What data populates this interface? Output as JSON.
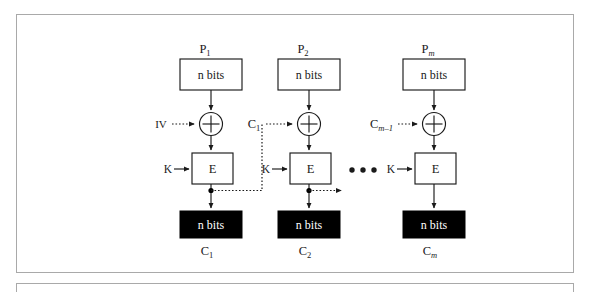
{
  "figure": {
    "kind": "cbc-encryption-block-diagram",
    "top_remnant_text": "                       ",
    "frame_color": "#a9a9a9",
    "ink_color": "#1a1a1a",
    "cipher_fill": "#000000",
    "cipher_text_color": "#ffffff"
  },
  "labels": {
    "plaintext_box_text": "n bits",
    "ciphertext_box_text": "n bits",
    "cipher_label": "E",
    "key_label": "K",
    "iv_label": "IV",
    "xor_glyph": "+",
    "ellipsis": "• • •"
  },
  "columns": [
    {
      "id": "block-1",
      "plaintext_label_base": "P",
      "plaintext_label_sub": "1",
      "plaintext_sub_italic": false,
      "plaintext_box_text": "n bits",
      "xor_input_label_base": "IV",
      "xor_input_label_sub": "",
      "xor_input_sub_italic": false,
      "key_label": "K",
      "cipher_label": "E",
      "ciphertext_box_text": "n bits",
      "ciphertext_label_base": "C",
      "ciphertext_label_sub": "1",
      "ciphertext_sub_italic": false
    },
    {
      "id": "block-2",
      "plaintext_label_base": "P",
      "plaintext_label_sub": "2",
      "plaintext_sub_italic": false,
      "plaintext_box_text": "n bits",
      "xor_input_label_base": "C",
      "xor_input_label_sub": "1",
      "xor_input_sub_italic": false,
      "key_label": "K",
      "cipher_label": "E",
      "ciphertext_box_text": "n bits",
      "ciphertext_label_base": "C",
      "ciphertext_label_sub": "2",
      "ciphertext_sub_italic": false
    },
    {
      "id": "block-m",
      "plaintext_label_base": "P",
      "plaintext_label_sub": "m",
      "plaintext_sub_italic": true,
      "plaintext_box_text": "n bits",
      "xor_input_label_base": "C",
      "xor_input_label_sub": "m–1",
      "xor_input_sub_italic": true,
      "key_label": "K",
      "cipher_label": "E",
      "ciphertext_box_text": "n bits",
      "ciphertext_label_base": "C",
      "ciphertext_label_sub": "m",
      "ciphertext_sub_italic": true
    }
  ]
}
